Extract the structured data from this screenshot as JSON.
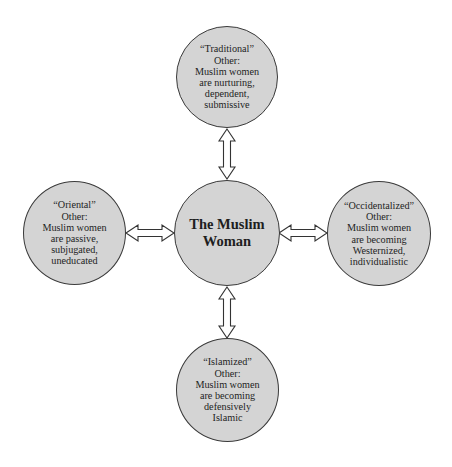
{
  "diagram": {
    "center": {
      "lines": [
        "The Muslim",
        "Woman"
      ]
    },
    "nodes": {
      "top": {
        "label": "“Traditional”",
        "lines": [
          "“Traditional”",
          "Other:",
          "Muslim women",
          "are nurturing,",
          "dependent,",
          "submissive"
        ]
      },
      "left": {
        "label": "“Oriental”",
        "lines": [
          "“Oriental”",
          "Other:",
          "Muslim women",
          "are passive,",
          "subjugated,",
          "uneducated"
        ]
      },
      "right": {
        "label": "“Occidentalized”",
        "lines": [
          "“Occidentalized”",
          "Other:",
          "Muslim women",
          "are becoming",
          "Westernized,",
          "individualistic"
        ]
      },
      "bottom": {
        "label": "“Islamized”",
        "lines": [
          "“Islamized”",
          "Other:",
          "Muslim women",
          "are becoming",
          "defensively",
          "Islamic"
        ]
      }
    },
    "connectors": [
      {
        "from": "center",
        "to": "top",
        "type": "double-arrow"
      },
      {
        "from": "center",
        "to": "left",
        "type": "double-arrow"
      },
      {
        "from": "center",
        "to": "right",
        "type": "double-arrow"
      },
      {
        "from": "center",
        "to": "bottom",
        "type": "double-arrow"
      }
    ],
    "colors": {
      "node_fill": "#d4d4d4",
      "node_stroke": "#3a3a3a",
      "arrow_fill": "#ffffff",
      "arrow_stroke": "#333333"
    }
  }
}
